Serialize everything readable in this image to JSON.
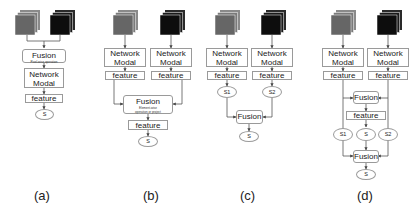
{
  "panels": {
    "a": {
      "caption": "(a)",
      "fusion_title": "Fusion",
      "fusion_sub": "Pixel-wise operation",
      "network_line1": "Network",
      "network_line2": "Modal",
      "feature": "feature",
      "output": "S"
    },
    "b": {
      "caption": "(b)",
      "network_line1": "Network",
      "network_line2": "Modal",
      "feature": "feature",
      "fusion_title": "Fusion",
      "fusion_sub1": "Element-wise",
      "fusion_sub2": "operation or project",
      "output": "S"
    },
    "c": {
      "caption": "(c)",
      "network_line1": "Network",
      "network_line2": "Modal",
      "feature": "feature",
      "s1": "S1",
      "s2": "S2",
      "fusion_title": "Fusion",
      "output": "S"
    },
    "d": {
      "caption": "(d)",
      "network_line1": "Network",
      "network_line2": "Modal",
      "feature": "feature",
      "fusion_title": "Fusion",
      "s1": "S1",
      "s_mid": "S",
      "s2": "S2",
      "output": "S"
    }
  },
  "colors": {
    "rgb_cube": "#6b6b6b",
    "depth_cube": "#111111",
    "line": "#555555",
    "box_border": "#9a9a9a"
  }
}
